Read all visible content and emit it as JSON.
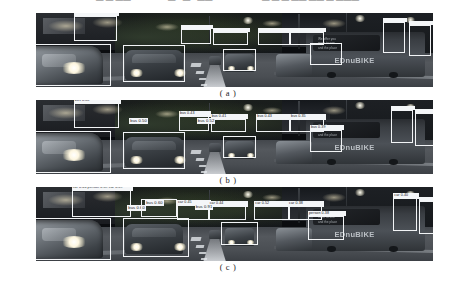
{
  "top_text": {
    "fragments": [
      {
        "text": "—  —  ——",
        "x": 96
      },
      {
        "text": "— • — • ——",
        "x": 168
      },
      {
        "text": "— — — —— —— — ———",
        "x": 262
      }
    ]
  },
  "figure": {
    "panels": [
      {
        "id": "panel-a",
        "caption": "( a )",
        "scene": {
          "bus_brand_text": "EDnuBIKE",
          "bus_ad_text": "We offer you\nmore to see\nand the place"
        },
        "detections": [
          {
            "name": "storefront-left",
            "x": 9.5,
            "y": 4,
            "w": 11.0,
            "h": 34,
            "label": "",
            "label_w": 11.0
          },
          {
            "name": "car-left-near",
            "x": -1.0,
            "y": 42,
            "w": 20.0,
            "h": 56,
            "label": "",
            "label_w": 0
          },
          {
            "name": "car-mid-front",
            "x": 22.0,
            "y": 43,
            "w": 15.5,
            "h": 50,
            "label": "",
            "label_w": 0
          },
          {
            "name": "bus-mid-left",
            "x": 36.5,
            "y": 22,
            "w": 7.5,
            "h": 20,
            "label": "",
            "label_w": 7.5
          },
          {
            "name": "bus-center-left",
            "x": 44.5,
            "y": 25,
            "w": 9.0,
            "h": 18,
            "label": "",
            "label_w": 9.0
          },
          {
            "name": "car-center",
            "x": 47.0,
            "y": 48,
            "w": 8.5,
            "h": 30,
            "label": "",
            "label_w": 0
          },
          {
            "name": "bus-center",
            "x": 56.0,
            "y": 25,
            "w": 8.0,
            "h": 18,
            "label": "",
            "label_w": 8.0
          },
          {
            "name": "bus-center-right",
            "x": 64.0,
            "y": 26,
            "w": 8.5,
            "h": 17,
            "label": "",
            "label_w": 8.5
          },
          {
            "name": "van-right",
            "x": 69.0,
            "y": 40,
            "w": 8.0,
            "h": 30,
            "label": "",
            "label_w": 0
          },
          {
            "name": "sign-right-a",
            "x": 87.5,
            "y": 12,
            "w": 5.5,
            "h": 42,
            "label": "",
            "label_w": 5.5
          },
          {
            "name": "sign-right-b",
            "x": 94.0,
            "y": 16,
            "w": 5.5,
            "h": 42,
            "label": "",
            "label_w": 5.5
          }
        ]
      },
      {
        "id": "panel-b",
        "caption": "( b )",
        "scene": {
          "bus_brand_text": "EDnuBIKE",
          "bus_ad_text": "We offer you\nmore to see\nand the place"
        },
        "detections": [
          {
            "name": "storefront-left",
            "x": 9.5,
            "y": 4,
            "w": 11.5,
            "h": 34,
            "label": "bus 0.38",
            "label_w": 11.5
          },
          {
            "name": "car-left-near",
            "x": -1.0,
            "y": 42,
            "w": 20.0,
            "h": 56,
            "label": "",
            "label_w": 0
          },
          {
            "name": "car-mid-front",
            "x": 22.0,
            "y": 43,
            "w": 15.5,
            "h": 50,
            "label": "bus 0.50",
            "label_w": 0,
            "floating_label": true,
            "lx": 23.5,
            "ly": 24
          },
          {
            "name": "bus-mid-left",
            "x": 36.0,
            "y": 22,
            "w": 7.5,
            "h": 20,
            "label": "bus 0.43",
            "label_w": 7.5
          },
          {
            "name": "bus-center-left",
            "x": 44.0,
            "y": 25,
            "w": 9.0,
            "h": 18,
            "label": "bus 0.41",
            "label_w": 9.0
          },
          {
            "name": "car-center",
            "x": 47.0,
            "y": 48,
            "w": 8.5,
            "h": 30,
            "label": "bus 0.52",
            "label_w": 0,
            "floating_label": true,
            "lx": 40.5,
            "ly": 24
          },
          {
            "name": "bus-center",
            "x": 55.5,
            "y": 25,
            "w": 8.5,
            "h": 18,
            "label": "bus 0.43",
            "label_w": 8.5
          },
          {
            "name": "bus-center-right",
            "x": 64.0,
            "y": 26,
            "w": 8.5,
            "h": 17,
            "label": "bus 0.35",
            "label_w": 8.5
          },
          {
            "name": "van-right",
            "x": 69.0,
            "y": 40,
            "w": 8.0,
            "h": 30,
            "label": "bus 0.39",
            "label_w": 8.0
          },
          {
            "name": "sign-right-a",
            "x": 89.5,
            "y": 14,
            "w": 5.5,
            "h": 44,
            "label": "",
            "label_w": 5.5
          },
          {
            "name": "sign-right-b",
            "x": 95.5,
            "y": 18,
            "w": 5.0,
            "h": 44,
            "label": "",
            "label_w": 5.0
          }
        ]
      },
      {
        "id": "panel-c",
        "caption": "( c )",
        "scene": {
          "bus_brand_text": "EDnuBIKE",
          "bus_ad_text": "We offer you\nmore to see\nand the place"
        },
        "detections": [
          {
            "name": "storefront-left",
            "x": 9.0,
            "y": 4,
            "w": 15.0,
            "h": 36,
            "label": "car 0.66  person 0.39  car 0.59",
            "label_w": 15.0
          },
          {
            "name": "car-left-near",
            "x": -1.0,
            "y": 42,
            "w": 20.0,
            "h": 56,
            "label": "",
            "label_w": 0
          },
          {
            "name": "car-mid-front",
            "x": 22.0,
            "y": 42,
            "w": 16.5,
            "h": 52,
            "label": "bus 0.60",
            "label_w": 0,
            "floating_label": true,
            "lx": 23.0,
            "ly": 24
          },
          {
            "name": "bus-upper",
            "x": 26.5,
            "y": 16,
            "w": 9.0,
            "h": 24,
            "label": "bus 0.60",
            "label_w": 0,
            "floating_label": true,
            "lx": 27.5,
            "ly": 17
          },
          {
            "name": "bus-mid-left",
            "x": 35.5,
            "y": 24,
            "w": 8.0,
            "h": 20,
            "label": "car 0.45",
            "label_w": 8.0
          },
          {
            "name": "bus-center-left",
            "x": 43.5,
            "y": 26,
            "w": 9.5,
            "h": 18,
            "label": "car 0.44",
            "label_w": 9.5
          },
          {
            "name": "car-center",
            "x": 46.5,
            "y": 47,
            "w": 9.5,
            "h": 32,
            "label": "bus 0.91",
            "label_w": 0,
            "floating_label": true,
            "lx": 40.0,
            "ly": 23
          },
          {
            "name": "bus-center",
            "x": 55.0,
            "y": 25,
            "w": 9.0,
            "h": 19,
            "label": "car 0.52",
            "label_w": 9.0
          },
          {
            "name": "bus-center-right",
            "x": 63.5,
            "y": 26,
            "w": 8.5,
            "h": 18,
            "label": "car 0.38",
            "label_w": 8.5
          },
          {
            "name": "van-right",
            "x": 68.5,
            "y": 39,
            "w": 9.0,
            "h": 32,
            "label": "person 0.38",
            "label_w": 9.0
          },
          {
            "name": "sign-right-a",
            "x": 90.0,
            "y": 15,
            "w": 6.0,
            "h": 44,
            "label": "car 0.40",
            "label_w": 6.0
          },
          {
            "name": "sign-right-b",
            "x": 96.5,
            "y": 19,
            "w": 4.5,
            "h": 44,
            "label": "",
            "label_w": 4.5
          }
        ]
      }
    ]
  }
}
